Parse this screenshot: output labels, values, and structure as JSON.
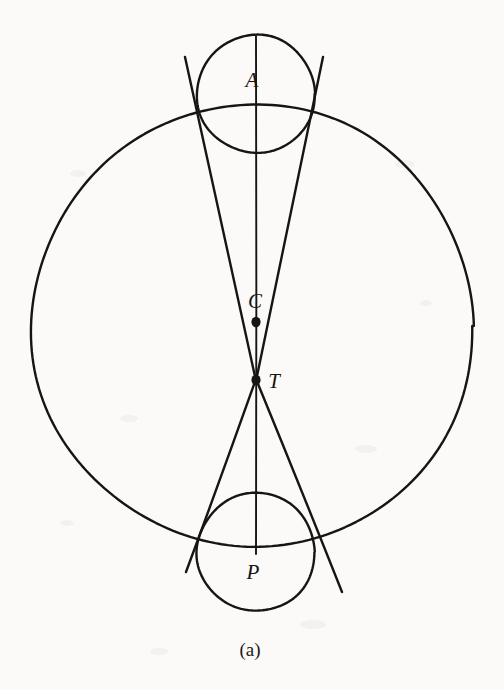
{
  "figure": {
    "caption": "(a)",
    "background_color": "#fbfaf8",
    "ink_color": "#151515",
    "labels": [
      {
        "name": "point-label-A",
        "text": "A",
        "x": 252,
        "y": 80
      },
      {
        "name": "point-label-C",
        "text": "C",
        "x": 255,
        "y": 301
      },
      {
        "name": "point-label-T",
        "text": "T",
        "x": 274,
        "y": 381
      },
      {
        "name": "point-label-P",
        "text": "P",
        "x": 253,
        "y": 572
      }
    ],
    "points": [
      {
        "name": "point-C",
        "label": "C",
        "x": 256,
        "y": 322,
        "r": 4.6
      },
      {
        "name": "point-T",
        "label": "T",
        "x": 256,
        "y": 380,
        "r": 4.6
      }
    ],
    "circles": [
      {
        "name": "large-circle",
        "cx": 253,
        "cy": 326,
        "r": 221,
        "stroke_width": 2.4
      },
      {
        "name": "upper-small-circle",
        "cx": 256,
        "cy": 94,
        "r": 59,
        "stroke_width": 2.4
      },
      {
        "name": "lower-small-circle",
        "cx": 256,
        "cy": 552,
        "r": 59,
        "stroke_width": 2.4
      }
    ],
    "segments": [
      {
        "name": "axis-line-AP",
        "x1": 256,
        "y1": 36,
        "x2": 256,
        "y2": 554,
        "stroke_width": 1.9
      },
      {
        "name": "tangent-left-upper",
        "x1": 185,
        "y1": 57,
        "x2": 256,
        "y2": 381,
        "stroke_width": 2.4
      },
      {
        "name": "tangent-right-upper",
        "x1": 323,
        "y1": 57,
        "x2": 256,
        "y2": 381,
        "stroke_width": 2.4
      },
      {
        "name": "tangent-left-lower",
        "x1": 256,
        "y1": 379,
        "x2": 186,
        "y2": 572,
        "stroke_width": 2.4
      },
      {
        "name": "tangent-right-lower",
        "x1": 256,
        "y1": 379,
        "x2": 342,
        "y2": 592,
        "stroke_width": 2.4
      }
    ]
  },
  "chart_data": {
    "type": "diagram",
    "title": "(a)",
    "named_points": [
      "A",
      "C",
      "T",
      "P"
    ],
    "elements": [
      "large-circle",
      "upper-small-circle",
      "lower-small-circle",
      "axis-line-AP",
      "tangent-left-upper",
      "tangent-right-upper",
      "tangent-left-lower",
      "tangent-right-lower"
    ]
  }
}
